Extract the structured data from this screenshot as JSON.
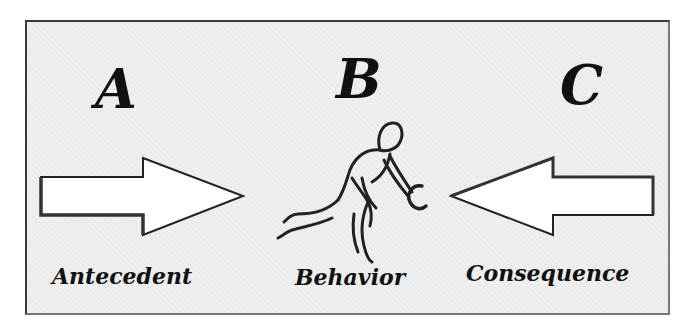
{
  "diagram": {
    "letters": {
      "a": "A",
      "b": "B",
      "c": "C"
    },
    "captions": {
      "a": "Antecedent",
      "b": "Behavior",
      "c": "Consequence"
    },
    "icons": {
      "left_arrow": "arrow-right-icon",
      "right_arrow": "arrow-left-icon",
      "figure": "person-bowling-icon"
    },
    "colors": {
      "background": "#efefef",
      "ink": "#111111",
      "arrow_fill": "#ffffff",
      "border": "#3a3a3a"
    }
  }
}
